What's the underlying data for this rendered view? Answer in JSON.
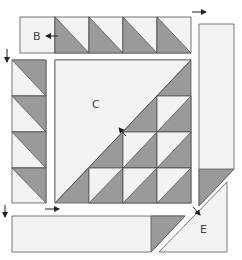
{
  "diagram": {
    "colors": {
      "light": "#f3f3f3",
      "dark": "#9a9a9a",
      "stroke": "#555555",
      "arrow": "#222222",
      "label": "#444444"
    },
    "labels": {
      "B": "B",
      "C": "C",
      "E": "E"
    },
    "pieces": [
      {
        "id": "B",
        "description": "Top row: plain square plus 4 half-square triangle units"
      },
      {
        "id": "left-strip",
        "description": "Left column of 4 half-square triangle units"
      },
      {
        "id": "C",
        "description": "Center square: large light triangle with dark/light triangle units"
      },
      {
        "id": "right-strip",
        "description": "Right vertical strip with dark triangle at bottom"
      },
      {
        "id": "bottom-strip",
        "description": "Bottom horizontal strip with dark triangle at right end"
      },
      {
        "id": "E",
        "description": "Corner light triangle"
      }
    ],
    "arrows": [
      {
        "name": "arrow-b",
        "direction": "left"
      },
      {
        "name": "arrow-top-right",
        "direction": "right"
      },
      {
        "name": "arrow-left-strip",
        "direction": "down"
      },
      {
        "name": "arrow-c",
        "direction": "up-left"
      },
      {
        "name": "arrow-bottom-left",
        "direction": "down"
      },
      {
        "name": "arrow-bottom-strip",
        "direction": "right"
      },
      {
        "name": "arrow-e",
        "direction": "down-right"
      }
    ]
  }
}
